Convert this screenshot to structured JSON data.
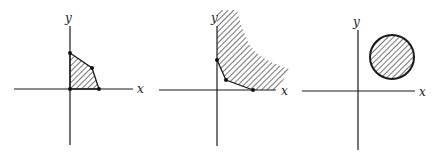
{
  "figure": {
    "panels": [
      {
        "id": "bounded-polygon",
        "axis_labels": {
          "x": "x",
          "y": "y"
        },
        "region": "bounded convex polygon in first quadrant (hatched)",
        "vertices_marked": 4
      },
      {
        "id": "unbounded-region",
        "axis_labels": {
          "x": "x",
          "y": "y"
        },
        "region": "unbounded convex region above a piecewise-linear boundary (hatched)",
        "vertices_marked": 3
      },
      {
        "id": "disk",
        "axis_labels": {
          "x": "x",
          "y": "y"
        },
        "region": "closed disk in first quadrant (hatched)",
        "vertices_marked": 0
      }
    ],
    "colors": {
      "ink": "#1a1a1a",
      "background": "#ffffff"
    }
  }
}
